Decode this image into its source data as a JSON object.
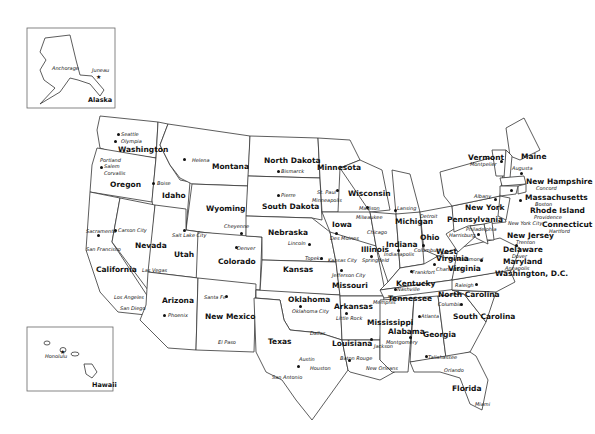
{
  "map": {
    "title": "United States Capitals",
    "insets": [
      {
        "name": "Alaska",
        "cities": [
          "Anchorage",
          "Juneau"
        ]
      },
      {
        "name": "Hawaii",
        "cities": [
          "Honolulu"
        ]
      }
    ],
    "states": [
      {
        "name": "Washington",
        "capital": "Olympia",
        "cities": [
          "Seattle"
        ]
      },
      {
        "name": "Oregon",
        "capital": "Salem",
        "cities": [
          "Portland",
          "Corvallis"
        ]
      },
      {
        "name": "California",
        "capital": "Sacramento",
        "cities": [
          "San Francisco",
          "Los Angeles",
          "San Diego"
        ]
      },
      {
        "name": "Idaho",
        "capital": "Boise"
      },
      {
        "name": "Nevada",
        "capital": "Carson City",
        "cities": [
          "Las Vegas"
        ]
      },
      {
        "name": "Montana",
        "capital": "Helena"
      },
      {
        "name": "Wyoming",
        "capital": "Cheyenne"
      },
      {
        "name": "Utah",
        "capital": "Salt Lake City"
      },
      {
        "name": "Colorado",
        "capital": "Denver"
      },
      {
        "name": "Arizona",
        "capital": "Phoenix"
      },
      {
        "name": "New Mexico",
        "capital": "Santa Fe",
        "cities": [
          "El Paso"
        ]
      },
      {
        "name": "North Dakota",
        "capital": "Bismarck"
      },
      {
        "name": "South Dakota",
        "capital": "Pierre"
      },
      {
        "name": "Nebraska",
        "capital": "Lincoln"
      },
      {
        "name": "Kansas",
        "capital": "Topeka"
      },
      {
        "name": "Oklahoma",
        "capital": "Oklahoma City"
      },
      {
        "name": "Texas",
        "capital": "Austin",
        "cities": [
          "Dallas",
          "Houston",
          "San Antonio"
        ]
      },
      {
        "name": "Minnesota",
        "capital": "St. Paul",
        "cities": [
          "Minneapolis"
        ]
      },
      {
        "name": "Iowa",
        "capital": "Des Moines"
      },
      {
        "name": "Missouri",
        "capital": "Jefferson City",
        "cities": [
          "Kansas City"
        ]
      },
      {
        "name": "Arkansas",
        "capital": "Little Rock"
      },
      {
        "name": "Louisiana",
        "capital": "Baton Rouge",
        "cities": [
          "New Orleans"
        ]
      },
      {
        "name": "Wisconsin",
        "capital": "Madison",
        "cities": [
          "Milwaukee"
        ]
      },
      {
        "name": "Illinois",
        "capital": "Springfield",
        "cities": [
          "Chicago"
        ]
      },
      {
        "name": "Michigan",
        "capital": "Lansing",
        "cities": [
          "Detroit"
        ]
      },
      {
        "name": "Indiana",
        "capital": "Indianapolis"
      },
      {
        "name": "Ohio",
        "capital": "Columbus"
      },
      {
        "name": "Kentucky",
        "capital": "Frankfort"
      },
      {
        "name": "Tennessee",
        "capital": "Nashville",
        "cities": [
          "Memphis"
        ]
      },
      {
        "name": "Mississippi",
        "capital": "Jackson"
      },
      {
        "name": "Alabama",
        "capital": "Montgomery"
      },
      {
        "name": "Georgia",
        "capital": "Atlanta"
      },
      {
        "name": "Florida",
        "capital": "Tallahassee",
        "cities": [
          "Orlando",
          "Miami"
        ]
      },
      {
        "name": "South Carolina",
        "capital": "Columbia"
      },
      {
        "name": "North Carolina",
        "capital": "Raleigh"
      },
      {
        "name": "Virginia",
        "capital": "Richmond"
      },
      {
        "name": "West Virginia",
        "capital": "Charleston"
      },
      {
        "name": "Pennsylvania",
        "capital": "Harrisburg",
        "cities": [
          "Philadelphia"
        ]
      },
      {
        "name": "New York",
        "capital": "Albany",
        "cities": [
          "New York City"
        ]
      },
      {
        "name": "Vermont",
        "capital": "Montpelier"
      },
      {
        "name": "Maine",
        "capital": "Augusta"
      },
      {
        "name": "New Hampshire",
        "capital": "Concord"
      },
      {
        "name": "Massachusetts",
        "capital": "Boston"
      },
      {
        "name": "Rhode Island",
        "capital": "Providence"
      },
      {
        "name": "Connecticut",
        "capital": "Hartford"
      },
      {
        "name": "New Jersey",
        "capital": "Trenton"
      },
      {
        "name": "Delaware",
        "capital": "Dover"
      },
      {
        "name": "Maryland",
        "capital": "Annapolis"
      },
      {
        "name": "Washington, D.C."
      }
    ]
  }
}
